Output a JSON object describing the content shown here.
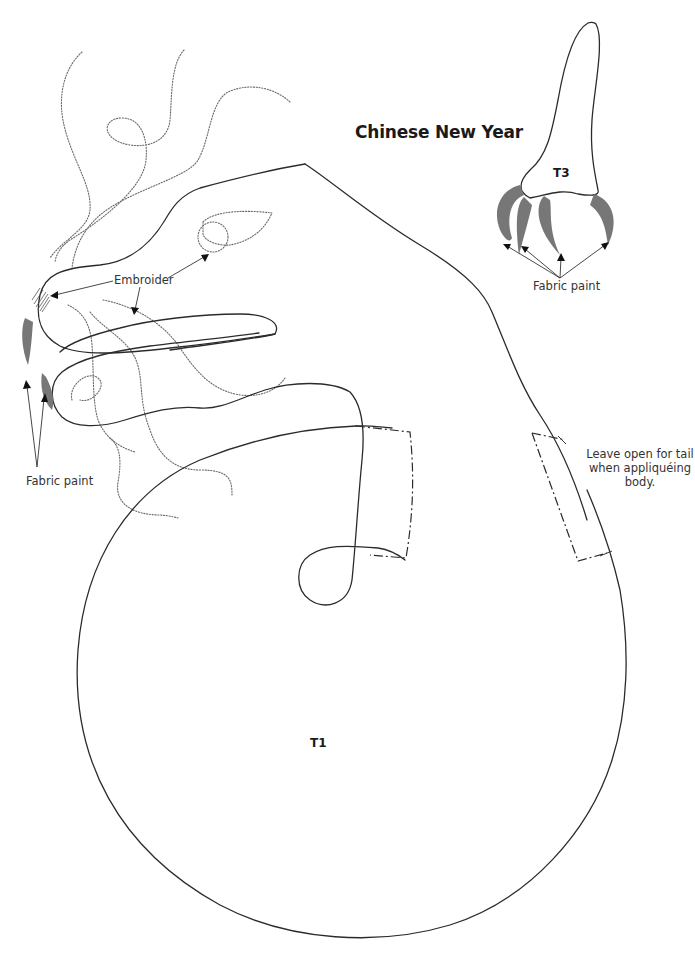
{
  "title": "Chinese New Year",
  "pieces": [
    {
      "id": "T1",
      "label": "T1"
    },
    {
      "id": "T3",
      "label": "T3"
    }
  ],
  "annotations": {
    "embroider": "Embroider",
    "fabric_paint_left": "Fabric paint",
    "fabric_paint_right": "Fabric paint",
    "leave_open_note": "Leave open for tail when appliquéing body."
  },
  "colors": {
    "outline": "#2b2b2b",
    "paint_fill": "#777777",
    "dotted_stitch": "#6a6a6a",
    "background": "#ffffff"
  }
}
